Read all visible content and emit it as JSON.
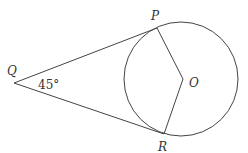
{
  "diagram": {
    "type": "geometry",
    "labels": {
      "Q": "Q",
      "P": "P",
      "O": "O",
      "R": "R",
      "angle": "45°"
    },
    "colors": {
      "stroke": "#444444",
      "text": "#333333",
      "background": "#ffffff"
    }
  }
}
